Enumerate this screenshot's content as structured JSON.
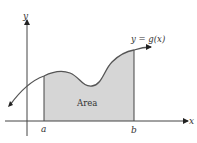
{
  "diagram": {
    "axes": {
      "x_label": "x",
      "y_label": "y"
    },
    "curve_label": "y = g(x)",
    "region_label": "Area",
    "bounds": {
      "lower": "a",
      "upper": "b"
    },
    "colors": {
      "fill": "#d6d6d6",
      "stroke": "#444444",
      "curve": "#555555"
    }
  }
}
